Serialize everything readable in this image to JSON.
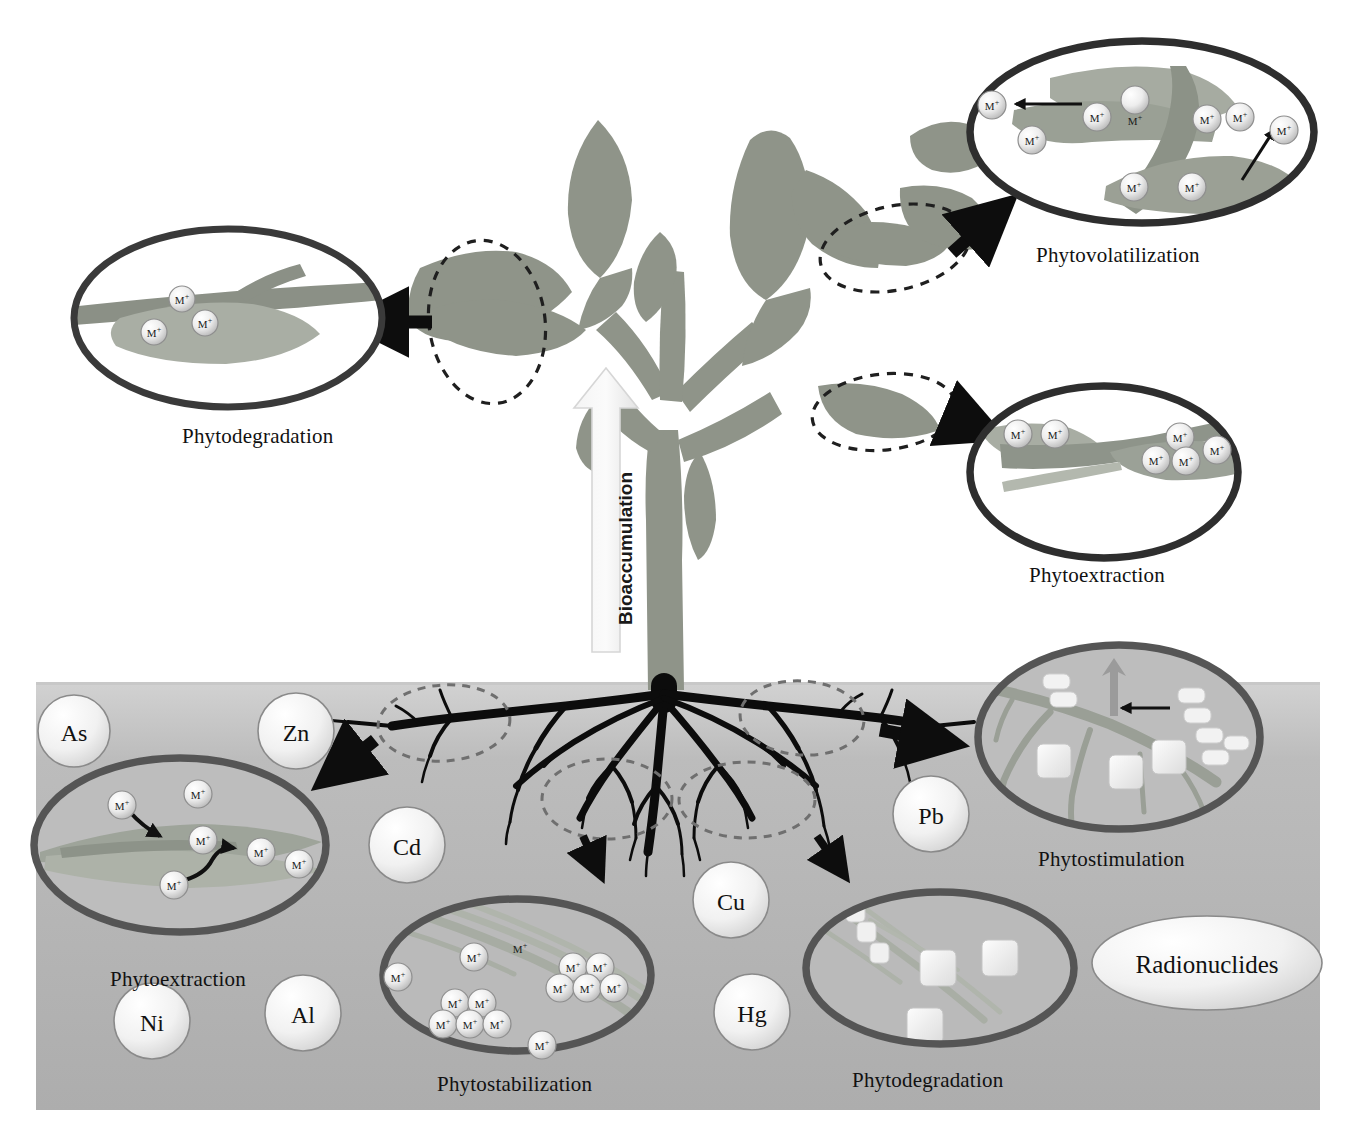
{
  "figure": {
    "type": "scientific-diagram",
    "background_color": "#ffffff",
    "soil_color": "#b0b0b0",
    "plant_color": "#8f9489",
    "root_color": "#101010",
    "callout_ring_color": "#4a4a4a",
    "dashed_ring_color": "#1f1f1f",
    "arrow_color": "#0d0d0d",
    "ion_symbol": "M",
    "ion_charge": "+"
  },
  "bioaccumulation": {
    "label": "Bioaccumulation",
    "direction": "upward"
  },
  "callouts": [
    {
      "id": "phytodegradation-leaf",
      "label": "Phytodegradation",
      "position": "top-left",
      "cx": 228,
      "cy": 318,
      "rx": 160,
      "ry": 95,
      "ion_count": 3,
      "ions": [
        {
          "x": 182,
          "y": 299
        },
        {
          "x": 154,
          "y": 332
        },
        {
          "x": 205,
          "y": 323
        }
      ],
      "caption_x": 182,
      "caption_y": 425,
      "inner_arrows": []
    },
    {
      "id": "phytovolatilization",
      "label": "Phytovolatilization",
      "position": "top-right",
      "cx": 1142,
      "cy": 132,
      "rx": 178,
      "ry": 97,
      "ion_count": 9,
      "ions": [
        {
          "x": 992,
          "y": 105
        },
        {
          "x": 1032,
          "y": 140
        },
        {
          "x": 1135,
          "y": 120
        },
        {
          "x": 1134,
          "y": 187
        },
        {
          "x": 1192,
          "y": 187
        },
        {
          "x": 1207,
          "y": 119
        },
        {
          "x": 1240,
          "y": 117
        },
        {
          "x": 1284,
          "y": 130
        },
        {
          "x": 1097,
          "y": 117
        }
      ],
      "caption_x": 1036,
      "caption_y": 258,
      "inner_arrows": [
        {
          "x1": 1082,
          "y1": 104,
          "x2": 1014,
          "y2": 104,
          "label": "leftward-release"
        },
        {
          "x1": 1242,
          "y1": 180,
          "x2": 1276,
          "y2": 128,
          "label": "upward-release"
        }
      ]
    },
    {
      "id": "phytoextraction-leaf",
      "label": "Phytoextraction",
      "position": "middle-right",
      "cx": 1104,
      "cy": 472,
      "rx": 140,
      "ry": 92,
      "ion_count": 6,
      "ions": [
        {
          "x": 1018,
          "y": 434
        },
        {
          "x": 1055,
          "y": 434
        },
        {
          "x": 1180,
          "y": 437
        },
        {
          "x": 1156,
          "y": 460
        },
        {
          "x": 1186,
          "y": 461
        },
        {
          "x": 1217,
          "y": 450
        }
      ],
      "caption_x": 1029,
      "caption_y": 578,
      "inner_arrows": []
    },
    {
      "id": "phytostimulation",
      "label": "Phytostimulation",
      "position": "soil-right",
      "cx": 1119,
      "cy": 737,
      "rx": 147,
      "ry": 98,
      "ion_count": 0,
      "ions": [],
      "caption_x": 1038,
      "caption_y": 862,
      "particle_squares": [
        {
          "x": 1058,
          "y": 763
        },
        {
          "x": 1128,
          "y": 772
        },
        {
          "x": 1170,
          "y": 757
        }
      ],
      "bacteria": [
        {
          "x": 1060,
          "y": 690
        },
        {
          "x": 1190,
          "y": 700
        },
        {
          "x": 1205,
          "y": 733
        },
        {
          "x": 1230,
          "y": 758
        }
      ],
      "inner_arrows": [
        {
          "x1": 1118,
          "y1": 710,
          "x2": 1118,
          "y2": 665,
          "label": "uptake-up"
        },
        {
          "x1": 1165,
          "y1": 708,
          "x2": 1118,
          "y2": 708,
          "label": "inward-left"
        }
      ]
    },
    {
      "id": "phytoextraction-root",
      "label": "Phytoextraction",
      "position": "soil-left",
      "cx": 180,
      "cy": 845,
      "rx": 152,
      "ry": 93,
      "ion_count": 6,
      "ions": [
        {
          "x": 122,
          "y": 805
        },
        {
          "x": 198,
          "y": 794
        },
        {
          "x": 203,
          "y": 840
        },
        {
          "x": 261,
          "y": 852
        },
        {
          "x": 299,
          "y": 864
        },
        {
          "x": 174,
          "y": 885
        }
      ],
      "caption_x": 110,
      "caption_y": 982,
      "inner_arrows": [
        {
          "x1": 130,
          "y1": 812,
          "x2": 163,
          "y2": 838,
          "label": "curved-uptake-1"
        },
        {
          "x1": 183,
          "y1": 882,
          "x2": 237,
          "y2": 850,
          "label": "curved-uptake-2"
        }
      ]
    },
    {
      "id": "phytostabilization",
      "label": "Phytostabilization",
      "position": "soil-center",
      "cx": 517,
      "cy": 975,
      "rx": 140,
      "ry": 82,
      "ion_count": 14,
      "ions": [
        {
          "x": 398,
          "y": 977
        },
        {
          "x": 474,
          "y": 957
        },
        {
          "x": 455,
          "y": 1003
        },
        {
          "x": 482,
          "y": 1003
        },
        {
          "x": 443,
          "y": 1024
        },
        {
          "x": 470,
          "y": 1024
        },
        {
          "x": 497,
          "y": 1024
        },
        {
          "x": 573,
          "y": 967
        },
        {
          "x": 600,
          "y": 967
        },
        {
          "x": 560,
          "y": 988
        },
        {
          "x": 587,
          "y": 988
        },
        {
          "x": 614,
          "y": 988
        },
        {
          "x": 542,
          "y": 1045
        },
        {
          "x": 520,
          "y": 948
        }
      ],
      "caption_x": 437,
      "caption_y": 1087,
      "inner_arrows": []
    },
    {
      "id": "phytodegradation-root",
      "label": "Phytodegradation",
      "position": "soil-right-lower",
      "cx": 940,
      "cy": 968,
      "rx": 140,
      "ry": 82,
      "ion_count": 0,
      "ions": [],
      "caption_x": 852,
      "caption_y": 1083,
      "particle_squares": [
        {
          "x": 938,
          "y": 968
        },
        {
          "x": 1000,
          "y": 958
        },
        {
          "x": 925,
          "y": 1026
        }
      ],
      "fragment_chain": [
        {
          "x": 855,
          "y": 912
        },
        {
          "x": 866,
          "y": 932
        },
        {
          "x": 880,
          "y": 953
        }
      ],
      "inner_arrows": []
    }
  ],
  "dashed_highlights": [
    {
      "id": "leaf-left",
      "cx": 487,
      "cy": 322,
      "rx": 58,
      "ry": 82,
      "rot": -8
    },
    {
      "id": "leaf-top-right",
      "cx": 895,
      "cy": 248,
      "rx": 76,
      "ry": 42,
      "rot": -12
    },
    {
      "id": "leaf-mid-right",
      "cx": 884,
      "cy": 412,
      "rx": 72,
      "ry": 38,
      "rot": -6
    },
    {
      "id": "root-left",
      "cx": 444,
      "cy": 723,
      "rx": 66,
      "ry": 38,
      "rot": -4
    },
    {
      "id": "root-right",
      "cx": 802,
      "cy": 718,
      "rx": 62,
      "ry": 37,
      "rot": 4
    },
    {
      "id": "root-center-lower",
      "cx": 607,
      "cy": 799,
      "rx": 65,
      "ry": 40,
      "rot": 0
    },
    {
      "id": "root-right-lower",
      "cx": 747,
      "cy": 800,
      "rx": 68,
      "ry": 38,
      "rot": 0
    }
  ],
  "connector_arrows": [
    {
      "id": "to-phytodegradation-leaf",
      "x1": 432,
      "y1": 322,
      "x2": 345,
      "y2": 322
    },
    {
      "id": "to-phytovolatilization",
      "x1": 952,
      "y1": 253,
      "x2": 1012,
      "y2": 200
    },
    {
      "id": "to-phytoextraction-leaf",
      "x1": 948,
      "y1": 415,
      "x2": 1000,
      "y2": 437
    },
    {
      "id": "to-phytoextraction-root",
      "x1": 375,
      "y1": 740,
      "x2": 318,
      "y2": 785
    },
    {
      "id": "to-phytostimulation",
      "x1": 880,
      "y1": 730,
      "x2": 960,
      "y2": 745
    },
    {
      "id": "to-phytostabilization",
      "x1": 583,
      "y1": 836,
      "x2": 603,
      "y2": 880
    },
    {
      "id": "to-phytodegradation-root",
      "x1": 817,
      "y1": 836,
      "x2": 848,
      "y2": 880
    }
  ],
  "soil": {
    "top_y": 682,
    "bottom_y": 1110,
    "left_x": 36,
    "right_x": 1320,
    "contaminants": [
      {
        "symbol": "As",
        "cx": 74,
        "cy": 731,
        "r": 36
      },
      {
        "symbol": "Zn",
        "cx": 296,
        "cy": 731,
        "r": 38
      },
      {
        "symbol": "Cd",
        "cx": 407,
        "cy": 845,
        "r": 38
      },
      {
        "symbol": "Pb",
        "cx": 931,
        "cy": 814,
        "r": 38
      },
      {
        "symbol": "Cu",
        "cx": 731,
        "cy": 900,
        "r": 38
      },
      {
        "symbol": "Hg",
        "cx": 752,
        "cy": 1012,
        "r": 38
      },
      {
        "symbol": "Ni",
        "cx": 152,
        "cy": 1021,
        "r": 38
      },
      {
        "symbol": "Al",
        "cx": 303,
        "cy": 1013,
        "r": 38
      }
    ],
    "radionuclides": {
      "label": "Radionuclides",
      "cx": 1207,
      "cy": 963,
      "rx": 115,
      "ry": 47
    }
  }
}
